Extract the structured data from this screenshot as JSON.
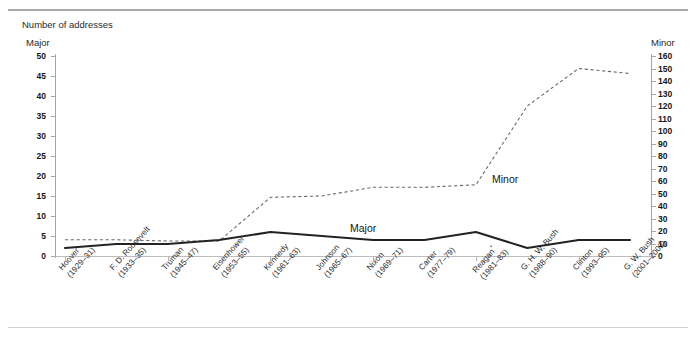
{
  "figure": {
    "unit_title": "Number of addresses",
    "caption_top": "",
    "caption_bottom": ""
  },
  "axes": {
    "left_title": "Major",
    "right_title": "Minor",
    "left_ticks": [
      "0",
      "5",
      "10",
      "15",
      "20",
      "25",
      "30",
      "35",
      "40",
      "45",
      "50"
    ],
    "right_ticks": [
      "0",
      "10",
      "20",
      "30",
      "40",
      "50",
      "60",
      "70",
      "80",
      "90",
      "100",
      "110",
      "120",
      "130",
      "140",
      "150",
      "160"
    ]
  },
  "series_labels": {
    "major": "Major",
    "minor": "Minor"
  },
  "chart_data": {
    "type": "line",
    "title": "Number of addresses",
    "xlabel": "",
    "ylabel": "Major",
    "y2label": "Minor",
    "ylim": [
      0,
      50
    ],
    "y2lim": [
      0,
      160
    ],
    "grid": false,
    "legend": "inline-annotations",
    "categories": [
      "Hoover (1929–31)",
      "F. D. Roosevelt (1933–35)",
      "Truman (1945–47)",
      "Eisenhower (1953–55)",
      "Kennedy (1961–63)",
      "Johnson (1965–67)",
      "Nixon (1969–71)",
      "Carter (1977–79)",
      "Reagan* (1981–83)",
      "G. H. W. Bush (1988–90)",
      "Clinton (1993–95)",
      "G. W. Bush (2001–2003)"
    ],
    "category_labels": [
      {
        "name": "Hoover",
        "years": "(1929–31)",
        "note": ""
      },
      {
        "name": "F. D. Roosevelt",
        "years": "(1933–35)",
        "note": ""
      },
      {
        "name": "Truman",
        "years": "(1945–47)",
        "note": ""
      },
      {
        "name": "Eisenhower",
        "years": "(1953–55)",
        "note": ""
      },
      {
        "name": "Kennedy",
        "years": "(1961–63)",
        "note": ""
      },
      {
        "name": "Johnson",
        "years": "(1965–67)",
        "note": ""
      },
      {
        "name": "Nixon",
        "years": "(1969–71)",
        "note": ""
      },
      {
        "name": "Carter",
        "years": "(1977–79)",
        "note": ""
      },
      {
        "name": "Reagan",
        "years": "(1981–83)",
        "note": "*"
      },
      {
        "name": "G. H. W. Bush",
        "years": "(1988–90)",
        "note": ""
      },
      {
        "name": "Clinton",
        "years": "(1993–95)",
        "note": ""
      },
      {
        "name": "G. W. Bush",
        "years": "(2001–2003)",
        "note": ""
      }
    ],
    "series": [
      {
        "name": "Major",
        "axis": "left",
        "style": "solid",
        "color": "#232323",
        "values": [
          2,
          3,
          3,
          4,
          6,
          5,
          4,
          4,
          6,
          2,
          4,
          4
        ]
      },
      {
        "name": "Minor",
        "axis": "right",
        "style": "dashed",
        "color": "#6a6a6a",
        "values": [
          13,
          13,
          12,
          12,
          47,
          48,
          55,
          55,
          57,
          120,
          150,
          146
        ]
      }
    ]
  }
}
